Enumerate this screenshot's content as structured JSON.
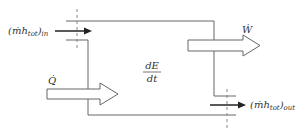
{
  "diagram": {
    "type": "control-volume energy balance",
    "labels": {
      "inlet": "(ṁh",
      "inlet_sub": "tot",
      "inlet_close": ")",
      "inlet_outer_sub": "in",
      "outlet": "(ṁh",
      "outlet_sub": "tot",
      "outlet_close": ")",
      "outlet_outer_sub": "out",
      "work": "Ẇ",
      "heat": "Q̇",
      "rate_numerator": "dE",
      "rate_denominator": "dt"
    },
    "colors": {
      "stroke": "#555555",
      "text": "#333333",
      "background": "#ffffff"
    }
  }
}
